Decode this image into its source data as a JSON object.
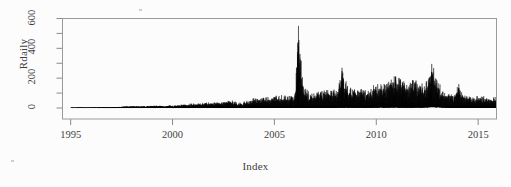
{
  "figure": {
    "background": "#fcfcfc",
    "plot_border_color": "#9a9a9a",
    "series_color": "#0a0a0a",
    "tick_color": "#8a8a8a",
    "text_color": "#3f3f3f"
  },
  "chart_data": {
    "type": "line",
    "title": "",
    "subtitle": "",
    "xlabel": "Index",
    "ylabel": "Rdaily",
    "xlim": [
      1994.6,
      2015.9
    ],
    "ylim": [
      -30,
      630
    ],
    "grid": false,
    "legend": null,
    "legend_position": "none",
    "x_ticks": [
      1995,
      2000,
      2005,
      2010,
      2015
    ],
    "x_tick_labels": [
      "1995",
      "2000",
      "2005",
      "2010",
      "2015"
    ],
    "y_ticks": [
      0,
      200,
      400,
      600
    ],
    "y_tick_labels": [
      "0",
      "200",
      "400",
      "600"
    ],
    "y_minor_ticks": [
      100,
      300,
      500
    ],
    "annotations": [
      {
        "x": 2006.18,
        "y": 600,
        "label": "maximum spike"
      },
      {
        "x": 2012.72,
        "y": 312,
        "label": "secondary spike"
      },
      {
        "x": 2008.32,
        "y": 288,
        "label": "secondary spike"
      },
      {
        "x": 2010.95,
        "y": 270,
        "label": "secondary spike"
      },
      {
        "x": 2014.05,
        "y": 172,
        "label": "late spike"
      }
    ],
    "envelope": [
      {
        "x": 1995.0,
        "low": 0,
        "high": 3
      },
      {
        "x": 1996.0,
        "low": 0,
        "high": 3
      },
      {
        "x": 1997.0,
        "low": 0,
        "high": 6
      },
      {
        "x": 1997.6,
        "low": 0,
        "high": 12
      },
      {
        "x": 1998.3,
        "low": 0,
        "high": 14
      },
      {
        "x": 1999.0,
        "low": 0,
        "high": 16
      },
      {
        "x": 1999.8,
        "low": 0,
        "high": 20
      },
      {
        "x": 2000.5,
        "low": 0,
        "high": 26
      },
      {
        "x": 2001.2,
        "low": 0,
        "high": 34
      },
      {
        "x": 2001.9,
        "low": 0,
        "high": 42
      },
      {
        "x": 2002.5,
        "low": 0,
        "high": 52
      },
      {
        "x": 2003.0,
        "low": 0,
        "high": 58
      },
      {
        "x": 2003.4,
        "low": 0,
        "high": 40
      },
      {
        "x": 2003.9,
        "low": 2,
        "high": 74
      },
      {
        "x": 2004.5,
        "low": 3,
        "high": 80
      },
      {
        "x": 2005.1,
        "low": 3,
        "high": 86
      },
      {
        "x": 2005.6,
        "low": 4,
        "high": 92
      },
      {
        "x": 2006.0,
        "low": 4,
        "high": 104
      },
      {
        "x": 2006.18,
        "low": 8,
        "high": 600
      },
      {
        "x": 2006.45,
        "low": 6,
        "high": 140
      },
      {
        "x": 2006.9,
        "low": 6,
        "high": 118
      },
      {
        "x": 2007.5,
        "low": 8,
        "high": 126
      },
      {
        "x": 2008.1,
        "low": 10,
        "high": 140
      },
      {
        "x": 2008.32,
        "low": 12,
        "high": 288
      },
      {
        "x": 2008.7,
        "low": 10,
        "high": 150
      },
      {
        "x": 2009.3,
        "low": 10,
        "high": 145
      },
      {
        "x": 2009.9,
        "low": 12,
        "high": 160
      },
      {
        "x": 2010.5,
        "low": 12,
        "high": 175
      },
      {
        "x": 2010.95,
        "low": 14,
        "high": 270
      },
      {
        "x": 2011.4,
        "low": 12,
        "high": 190
      },
      {
        "x": 2011.9,
        "low": 12,
        "high": 205
      },
      {
        "x": 2012.4,
        "low": 14,
        "high": 175
      },
      {
        "x": 2012.72,
        "low": 20,
        "high": 312
      },
      {
        "x": 2013.0,
        "low": 18,
        "high": 230
      },
      {
        "x": 2013.3,
        "low": 12,
        "high": 120
      },
      {
        "x": 2013.8,
        "low": 8,
        "high": 95
      },
      {
        "x": 2014.05,
        "low": 10,
        "high": 172
      },
      {
        "x": 2014.4,
        "low": 8,
        "high": 92
      },
      {
        "x": 2015.0,
        "low": 8,
        "high": 86
      },
      {
        "x": 2015.45,
        "low": 8,
        "high": 80
      }
    ]
  }
}
